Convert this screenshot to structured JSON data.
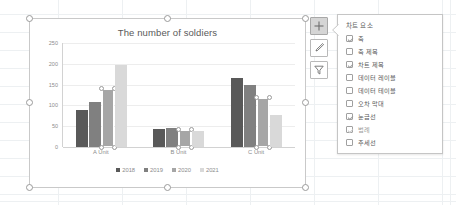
{
  "chart_data": {
    "type": "bar",
    "title": "The number of soldiers",
    "xlabel": "",
    "ylabel": "",
    "ylim": [
      0,
      250
    ],
    "yticks": [
      250,
      200,
      150,
      100,
      50,
      0
    ],
    "grid": true,
    "legend_position": "bottom",
    "categories": [
      "A Unit",
      "B Unit",
      "C Unit"
    ],
    "series": [
      {
        "name": "2018",
        "color": "#595959",
        "values": [
          88,
          44,
          167
        ]
      },
      {
        "name": "2019",
        "color": "#808080",
        "values": [
          108,
          46,
          148
        ]
      },
      {
        "name": "2020",
        "color": "#a6a6a6",
        "values": [
          140,
          42,
          118
        ],
        "selected": true
      },
      {
        "name": "2021",
        "color": "#d9d9d9",
        "values": [
          198,
          38,
          78
        ]
      }
    ]
  },
  "chart_object": {
    "selected": true,
    "handle_name": "selection-handle"
  },
  "side_buttons": [
    {
      "name": "chart-elements-button",
      "icon": "plus-icon",
      "active": true
    },
    {
      "name": "chart-styles-button",
      "icon": "paintbrush-icon",
      "active": false
    },
    {
      "name": "chart-filters-button",
      "icon": "funnel-icon",
      "active": false
    }
  ],
  "chart_elements_panel": {
    "title": "차트 요소",
    "items": [
      {
        "label": "축",
        "checked": true,
        "dim": false
      },
      {
        "label": "축 제목",
        "checked": false,
        "dim": false
      },
      {
        "label": "차트 제목",
        "checked": true,
        "dim": false
      },
      {
        "label": "데이터 레이블",
        "checked": false,
        "dim": false
      },
      {
        "label": "데이터 테이블",
        "checked": false,
        "dim": false
      },
      {
        "label": "오차 막대",
        "checked": false,
        "dim": false
      },
      {
        "label": "눈금선",
        "checked": true,
        "dim": false
      },
      {
        "label": "범례",
        "checked": true,
        "dim": true
      },
      {
        "label": "추세선",
        "checked": false,
        "dim": false
      }
    ]
  }
}
